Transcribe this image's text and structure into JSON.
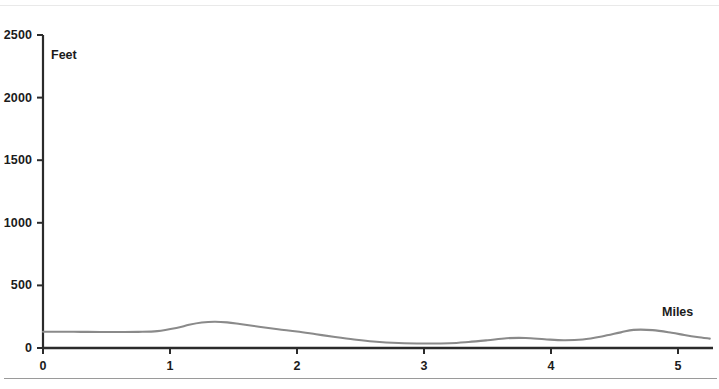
{
  "chart_data": {
    "type": "area",
    "title": "",
    "subtitle": "",
    "xlabel": "Miles",
    "ylabel": "Feet",
    "xlim": [
      0,
      5.25
    ],
    "ylim": [
      0,
      2600
    ],
    "grid": false,
    "legend": null,
    "x_ticks": [
      "0",
      "1",
      "2",
      "3",
      "4",
      "5"
    ],
    "x_tick_values": [
      0,
      1,
      2,
      3,
      4,
      5
    ],
    "y_ticks": [
      "0",
      "500",
      "1000",
      "1500",
      "2000",
      "2500"
    ],
    "y_tick_values": [
      0,
      500,
      1000,
      1500,
      2000,
      2500
    ],
    "series": [
      {
        "name": "Elevation",
        "color": "#8a8a8a",
        "x": [
          0.0,
          0.15,
          0.3,
          0.45,
          0.6,
          0.75,
          0.9,
          1.05,
          1.15,
          1.25,
          1.35,
          1.45,
          1.55,
          1.7,
          1.85,
          2.0,
          2.15,
          2.3,
          2.45,
          2.6,
          2.8,
          3.0,
          3.2,
          3.35,
          3.5,
          3.65,
          3.8,
          3.95,
          4.1,
          4.25,
          4.4,
          4.55,
          4.65,
          4.8,
          4.95,
          5.05,
          5.15,
          5.25
        ],
        "y": [
          130,
          130,
          129,
          128,
          128,
          129,
          135,
          160,
          185,
          203,
          210,
          205,
          192,
          170,
          150,
          132,
          110,
          88,
          68,
          52,
          40,
          36,
          38,
          48,
          62,
          78,
          80,
          70,
          62,
          68,
          92,
          125,
          145,
          143,
          122,
          104,
          88,
          75
        ]
      }
    ]
  },
  "axis_titles": {
    "y": "Feet",
    "x": "Miles"
  },
  "colors": {
    "curve": "#8a8a8a",
    "axis": "#2b2b2b",
    "text": "#1b1b1b",
    "top_rule": "#e9e9e9",
    "bottom_rule": "#9a9a9a",
    "background": "#ffffff"
  }
}
